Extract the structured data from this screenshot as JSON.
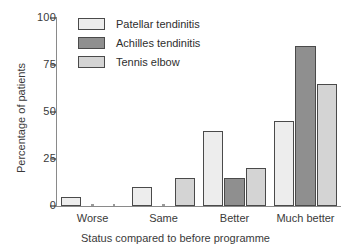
{
  "chart_data": {
    "type": "bar",
    "title": "",
    "subtitle": "",
    "xlabel": "Status compared to before programme",
    "ylabel": "Percentage of patients",
    "categories": [
      "Worse",
      "Same",
      "Better",
      "Much better"
    ],
    "series": [
      {
        "name": "Patellar tendinitis",
        "values": [
          5,
          10,
          40,
          45
        ],
        "color": "#ededed"
      },
      {
        "name": "Achilles tendinitis",
        "values": [
          0,
          0,
          15,
          85
        ],
        "color": "#8f8f8f"
      },
      {
        "name": "Tennis elbow",
        "values": [
          0,
          15,
          20,
          65
        ],
        "color": "#d4d4d4"
      }
    ],
    "ylim": [
      0,
      100
    ],
    "yticks": [
      0,
      25,
      50,
      75,
      100
    ],
    "ytick_labels": [
      "0",
      "25",
      "50",
      "75",
      "100"
    ],
    "xlim_note": "categorical",
    "grid": false,
    "legend_position": "top-left-inside",
    "bar_edge_color": "#4a4a4a",
    "axis_color": "#8a8a8a",
    "text_color": "#3a3a3a",
    "background": "#ffffff"
  }
}
